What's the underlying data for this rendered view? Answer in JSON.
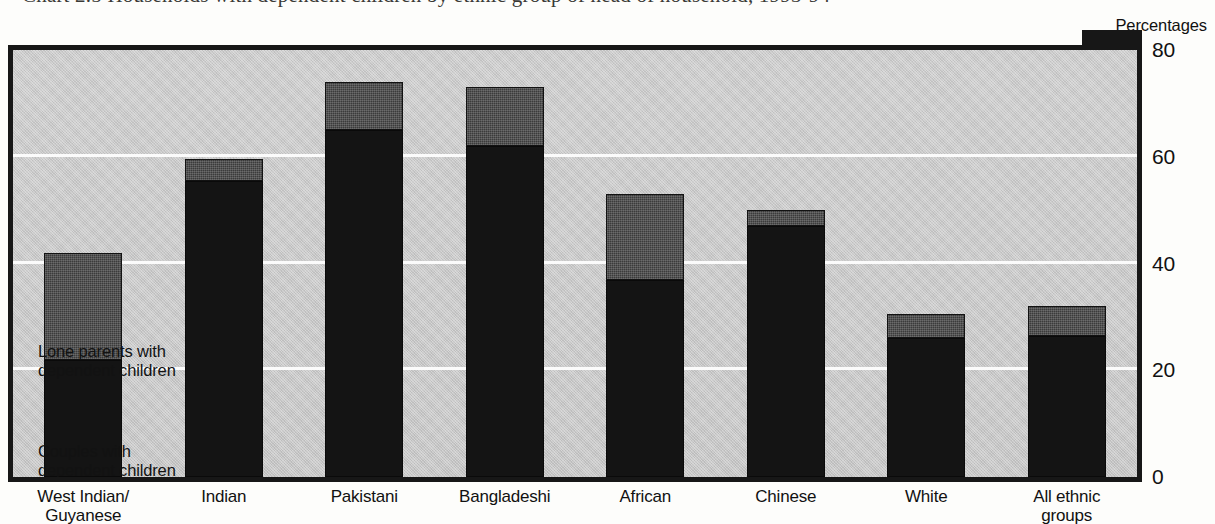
{
  "figure": {
    "units_label": "Percentages",
    "caption_remnant": "Chart 2.5 Households with dependent children by ethnic group of head of household, 1993-94"
  },
  "legend_notes": [
    {
      "key": "lone",
      "text": "Lone parents with\ndependent children"
    },
    {
      "key": "couples",
      "text": "Couples with\ndependent children"
    }
  ],
  "chart_data": {
    "type": "bar",
    "stacked": true,
    "title": "",
    "xlabel": "",
    "ylabel": "Percentages",
    "ylim": [
      0,
      80
    ],
    "yticks": [
      0,
      20,
      40,
      60,
      80
    ],
    "ytick_labels": [
      "0",
      "20",
      "40",
      "60",
      "80"
    ],
    "grid": true,
    "grid_axis": "y",
    "legend_position": "inside-left",
    "categories": [
      "West Indian/\nGuyanese",
      "Indian",
      "Pakistani",
      "Bangladeshi",
      "African",
      "Chinese",
      "White",
      "All ethnic\ngroups"
    ],
    "series": [
      {
        "name": "Couples with dependent children",
        "color": "#141414",
        "values": [
          22,
          55.5,
          65,
          62,
          37,
          47,
          26,
          26.5
        ]
      },
      {
        "name": "Lone parents with dependent children",
        "color": "#3b3b3b",
        "values": [
          20,
          4,
          9,
          11,
          16,
          3,
          4.5,
          5.5
        ]
      }
    ],
    "totals": [
      42,
      59.5,
      74,
      73,
      53,
      50,
      30.5,
      32
    ]
  }
}
